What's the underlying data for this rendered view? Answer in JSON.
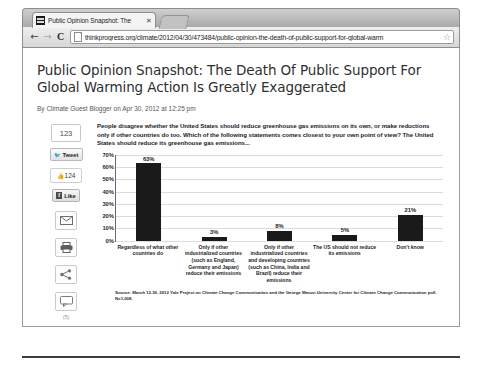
{
  "browser": {
    "tab": {
      "title": "Public Opinion Snapshot: The",
      "close_label": "✕",
      "favicon_name": "site-favicon"
    },
    "nav": {
      "back": "←",
      "forward": "→",
      "reload": "C"
    },
    "omnibox": {
      "url": "thinkprogress.org/climate/2012/04/30/473484/public-opinion-the-death-of-public-support-for-global-warm",
      "placeholder": "Search Google or type a URL",
      "star": "☆"
    }
  },
  "article": {
    "headline": "Public Opinion Snapshot: The Death Of Public Support For Global Warming Action Is Greatly Exaggerated",
    "byline": "By Climate Guest Blogger on Apr 30, 2012 at 12:25 pm"
  },
  "share_rail": {
    "share_count": "123",
    "tweet_label": "Tweet",
    "tweet_icon": "✉",
    "like_count": "124",
    "like_thumb": "☝",
    "facebook_label": "Like",
    "facebook_mark": "f",
    "email_icon": "email-icon",
    "print_icon": "print-icon",
    "share_icon": "share-icon",
    "comment_icon": "comment-icon",
    "comment_count": "(5)"
  },
  "chart_data": {
    "type": "bar",
    "title": "People disagree whether the United States should reduce greenhouse gas emissions on its own, or make reductions only if other countries do too. Which of the following statements comes closest to your own point of view? The United States should reduce its greenhouse gas emissions...",
    "categories": [
      "Regardless of what other countries do",
      "Only if other industrialized countries (such as England, Germany and Japan) reduce their emissions",
      "Only if other industrialized countries and developing countries (such as China, India and Brazil) reduce their emissions",
      "The US should not reduce its emissions",
      "Don't know"
    ],
    "values": [
      63,
      3,
      8,
      5,
      21
    ],
    "value_labels": [
      "63%",
      "3%",
      "8%",
      "5%",
      "21%"
    ],
    "ytick_labels": [
      "70%",
      "60%",
      "50%",
      "40%",
      "30%",
      "20%",
      "10%",
      "0%"
    ],
    "yticks": [
      70,
      60,
      50,
      40,
      30,
      20,
      10,
      0
    ],
    "ylim": [
      0,
      70
    ],
    "xlabel": "",
    "ylabel": "",
    "grid": true,
    "legend": "none",
    "bar_color": "#1a1a1a",
    "source": "Source: March 12-30, 2012 Yale Project on Climate Change Communication and the George Mason University Center for Climate Change Communication poll. N=1,008."
  }
}
